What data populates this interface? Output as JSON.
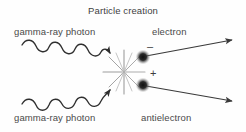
{
  "figure": {
    "title": "Particle creation",
    "background_color": "#fefefe",
    "ink_color": "#3d3d3d",
    "text_color": "#4a4a4a",
    "width": 246,
    "height": 132
  },
  "labels": {
    "title": "Particle creation",
    "photon_top": "gamma-ray photon",
    "photon_bottom": "gamma-ray photon",
    "electron": "electron",
    "antielectron": "antielectron"
  },
  "charges": {
    "electron_sign": "–",
    "antielectron_sign": "+"
  },
  "diagram": {
    "type": "pair-production",
    "interaction_point": {
      "x": 124,
      "y": 72
    },
    "burst_spokes": 12,
    "incoming": [
      {
        "name": "gamma-ray photon (upper)",
        "style": "wavy-arrow",
        "from": {
          "x": 22,
          "y": 47
        },
        "to": {
          "x": 118,
          "y": 72
        }
      },
      {
        "name": "gamma-ray photon (lower)",
        "style": "wavy-arrow",
        "from": {
          "x": 22,
          "y": 103
        },
        "to": {
          "x": 118,
          "y": 77
        }
      }
    ],
    "outgoing": [
      {
        "name": "electron",
        "style": "straight-arrow",
        "charge": "–",
        "particle_dot": {
          "x": 143,
          "y": 57
        },
        "to": {
          "x": 236,
          "y": 39
        }
      },
      {
        "name": "antielectron",
        "style": "straight-arrow",
        "charge": "+",
        "particle_dot": {
          "x": 143,
          "y": 85
        },
        "to": {
          "x": 236,
          "y": 101
        }
      }
    ]
  }
}
